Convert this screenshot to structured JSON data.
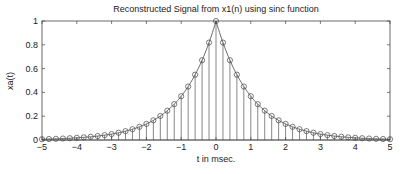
{
  "chart_data": {
    "type": "stem",
    "title": "Reconstructed Signal from x1(n) using sinc function",
    "xlabel": "t in msec.",
    "ylabel": "xa(t)",
    "xlim": [
      -5,
      5
    ],
    "ylim": [
      0,
      1
    ],
    "xticks": [
      -5,
      -4,
      -3,
      -2,
      -1,
      0,
      1,
      2,
      3,
      4,
      5
    ],
    "yticks": [
      0,
      0.2,
      0.4,
      0.6,
      0.8,
      1
    ],
    "ytick_labels": [
      "0",
      "0.2",
      "0.4",
      "0.6",
      "0.8",
      "1"
    ],
    "grid": false,
    "legend": null,
    "sample_spacing": 0.2,
    "x": [
      -5.0,
      -4.8,
      -4.6,
      -4.4,
      -4.2,
      -4.0,
      -3.8,
      -3.6,
      -3.4,
      -3.2,
      -3.0,
      -2.8,
      -2.6,
      -2.4,
      -2.2,
      -2.0,
      -1.8,
      -1.6,
      -1.4,
      -1.2,
      -1.0,
      -0.8,
      -0.6,
      -0.4,
      -0.2,
      0.0,
      0.2,
      0.4,
      0.6,
      0.8,
      1.0,
      1.2,
      1.4,
      1.6,
      1.8,
      2.0,
      2.2,
      2.4,
      2.6,
      2.8,
      3.0,
      3.2,
      3.4,
      3.6,
      3.8,
      4.0,
      4.2,
      4.4,
      4.6,
      4.8,
      5.0
    ],
    "values": [
      0.0067,
      0.0082,
      0.0101,
      0.0123,
      0.015,
      0.0183,
      0.0224,
      0.0273,
      0.0334,
      0.0408,
      0.0498,
      0.0608,
      0.0743,
      0.0907,
      0.1108,
      0.1353,
      0.1653,
      0.2019,
      0.2466,
      0.3012,
      0.3679,
      0.4493,
      0.5488,
      0.6703,
      0.8187,
      1.0,
      0.8187,
      0.6703,
      0.5488,
      0.4493,
      0.3679,
      0.3012,
      0.2466,
      0.2019,
      0.1653,
      0.1353,
      0.1108,
      0.0907,
      0.0743,
      0.0608,
      0.0498,
      0.0408,
      0.0334,
      0.0273,
      0.0224,
      0.0183,
      0.015,
      0.0123,
      0.0101,
      0.0082,
      0.0067
    ],
    "series_style": {
      "stem_color": "#555555",
      "marker": "circle-open",
      "line_color": "#444444",
      "continuous_overlay": true
    }
  }
}
